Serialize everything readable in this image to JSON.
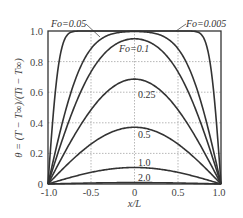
{
  "chart_data": {
    "type": "line",
    "title": "",
    "xlabel": "x/L",
    "ylabel": "θ = (T − T∞)/(Ti − T∞)",
    "xlim": [
      -1.0,
      1.0
    ],
    "ylim": [
      0,
      1.0
    ],
    "xticks": [
      "-1.0",
      "-0.5",
      "0",
      "0.5",
      "1.0"
    ],
    "yticks": [
      "0",
      "0.2",
      "0.4",
      "0.6",
      "0.8",
      "1.0"
    ],
    "grid": true,
    "legend": "inline labels",
    "series": [
      {
        "name": "Fo=0.005",
        "label": "Fo=0.005",
        "peak": 1.0
      },
      {
        "name": "Fo=0.05",
        "label": "Fo=0.05",
        "peak": 1.0
      },
      {
        "name": "Fo=0.1",
        "label": "Fo=0.1",
        "peak": 0.94
      },
      {
        "name": "Fo=0.25",
        "label": "0.25",
        "peak": 0.69
      },
      {
        "name": "Fo=0.5",
        "label": "0.5",
        "peak": 0.38
      },
      {
        "name": "Fo=1.0",
        "label": "1.0",
        "peak": 0.11
      },
      {
        "name": "Fo=2.0",
        "label": "2.0",
        "peak": 0.01
      }
    ],
    "x": [
      -1.0,
      -0.5,
      0,
      0.5,
      1.0
    ]
  },
  "labels": {
    "fo005": "Fo=0.005",
    "fo05": "Fo=0.05",
    "fo01": "Fo=0.1",
    "fo025": "0.25",
    "fo05b": "0.5",
    "fo1": "1.0",
    "fo2": "2.0"
  },
  "axes": {
    "xlabel": "x/L",
    "ylabel": "θ = (T − T∞)/(Ti − T∞)",
    "xticks": [
      "-1.0",
      "-0.5",
      "0",
      "0.5",
      "1.0"
    ],
    "yticks": [
      "0",
      "0.2",
      "0.4",
      "0.6",
      "0.8",
      "1.0"
    ]
  }
}
